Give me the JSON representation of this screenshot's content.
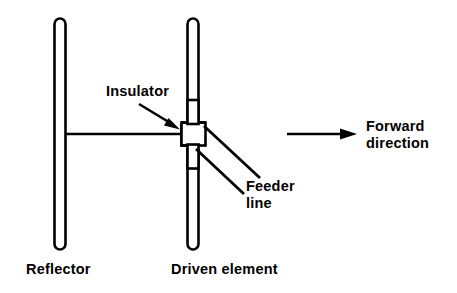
{
  "diagram": {
    "background_color": "#ffffff",
    "stroke_color": "#000000",
    "labels": {
      "insulator": "Insulator",
      "feeder_line_1": "Feeder",
      "feeder_line_2": "line",
      "forward_1": "Forward",
      "forward_2": "direction",
      "reflector": "Reflector",
      "driven_element": "Driven element"
    },
    "parts": [
      {
        "name": "reflector-rod",
        "shape": "hollow-rounded-rod",
        "orientation": "vertical",
        "x": 59,
        "y_top": 18,
        "y_bottom": 250,
        "width": 11
      },
      {
        "name": "driven-element-upper-rod",
        "shape": "hollow-rounded-rod",
        "orientation": "vertical",
        "x": 192,
        "y_top": 18,
        "y_bottom": 122,
        "width": 11
      },
      {
        "name": "driven-element-lower-rod",
        "shape": "hollow-rounded-rod",
        "orientation": "vertical",
        "x": 192,
        "y_top": 146,
        "y_bottom": 250,
        "width": 11
      },
      {
        "name": "boom",
        "shape": "horizontal-line",
        "x_start": 64,
        "x_end": 182,
        "y": 134
      },
      {
        "name": "insulator-block",
        "shape": "outlined-rectangle",
        "x": 181,
        "y": 122,
        "width": 24,
        "height": 24
      },
      {
        "name": "feeder-line-upper",
        "shape": "diagonal-line",
        "from": [
          205,
          127
        ],
        "to": [
          259,
          177
        ]
      },
      {
        "name": "feeder-line-lower",
        "shape": "diagonal-line",
        "from": [
          196,
          148
        ],
        "to": [
          243,
          192
        ]
      },
      {
        "name": "insulator-pointer-arrow",
        "shape": "arrow",
        "from": [
          140,
          105
        ],
        "to": [
          180,
          129
        ]
      },
      {
        "name": "forward-direction-arrow",
        "shape": "arrow",
        "from": [
          286,
          134
        ],
        "to": [
          356,
          134
        ]
      }
    ]
  }
}
